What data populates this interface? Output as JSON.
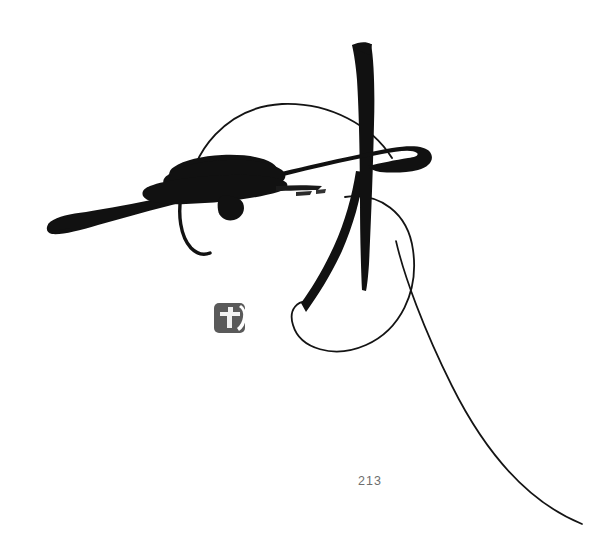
{
  "page": {
    "background_color": "#ffffff",
    "width": 605,
    "height": 557,
    "page_number": "213"
  },
  "artwork": {
    "title": "Calligraphic brush painting",
    "medium": "sumi ink on paper",
    "ink_color": "#111111",
    "seal": {
      "name": "artist-seal",
      "color": "#5a5a5a",
      "shape": "rounded-square",
      "x": 214,
      "y": 303,
      "width": 31,
      "height": 30,
      "glyph": "印"
    },
    "strokes": [
      {
        "name": "horizontal-sweep",
        "description": "long tapering horizontal brush stroke from lower-left to upper-right ending in a curled hook",
        "weight": "heavy"
      },
      {
        "name": "central-mass",
        "description": "dense wedge-shaped ink mass near center-left with dry-brush streaks",
        "weight": "heavy"
      },
      {
        "name": "ink-drip",
        "description": "small downward drip below the central mass",
        "weight": "medium"
      },
      {
        "name": "vertical-stem",
        "description": "long vertical stroke descending from top, tapering to a dry point",
        "weight": "heavy"
      },
      {
        "name": "thin-arc",
        "description": "fine arching line forming a dome above the horizontal sweep",
        "weight": "hairline"
      },
      {
        "name": "left-hook-curve",
        "description": "thin descending curve hooking to the right below the central mass",
        "weight": "light"
      },
      {
        "name": "descending-curve",
        "description": "tapering curved stroke falling from the sweep toward lower-center",
        "weight": "medium"
      },
      {
        "name": "large-loop",
        "description": "large thin open loop on the right side",
        "weight": "hairline"
      },
      {
        "name": "trailing-tail",
        "description": "long hairline tail sweeping to the lower-right corner",
        "weight": "hairline"
      }
    ]
  }
}
